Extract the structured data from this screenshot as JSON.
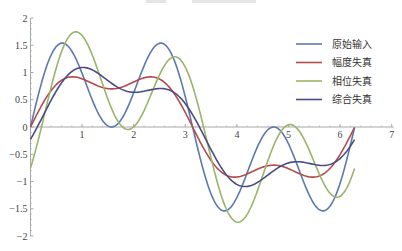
{
  "chart_data": {
    "type": "line",
    "title": "",
    "xlabel": "",
    "ylabel": "",
    "xlim": [
      0,
      7
    ],
    "ylim": [
      -2,
      2
    ],
    "x_ticks": [
      1,
      2,
      3,
      4,
      5,
      6,
      7
    ],
    "y_ticks": [
      -2,
      -1.5,
      -1,
      -0.5,
      0,
      0.5,
      1,
      1.5,
      2
    ],
    "x_tick_labels": [
      "1",
      "2",
      "3",
      "4",
      "5",
      "6",
      "7"
    ],
    "y_tick_labels": [
      "−2",
      "−1.5",
      "−1",
      "−0.5",
      "0",
      "0.5",
      "1",
      "1.5",
      "2"
    ],
    "grid": false,
    "legend_position": "upper right",
    "t_range": [
      0,
      6.28
    ],
    "x": [
      0,
      0.25,
      0.5,
      0.75,
      1.0,
      1.25,
      1.5,
      1.75,
      2.0,
      2.25,
      2.5,
      2.75,
      3.0,
      3.25,
      3.5,
      3.75,
      4.0,
      4.25,
      4.5,
      4.75,
      5.0,
      5.25,
      5.5,
      5.75,
      6.0,
      6.28
    ],
    "series": [
      {
        "name": "原始输入",
        "color": "#5b79ad",
        "formula": "sin(t) + sin(3t)",
        "values": [
          0.0,
          0.93,
          1.48,
          1.46,
          0.98,
          0.38,
          0.02,
          0.12,
          0.63,
          1.23,
          1.53,
          1.28,
          0.55,
          -0.21,
          -0.67,
          -0.65,
          -1.29,
          -1.53,
          -1.23,
          -0.63,
          -0.12,
          -0.02,
          -0.38,
          -0.98,
          -1.46,
          -0.0
        ]
      },
      {
        "name": "幅度失真",
        "color": "#b54a4a",
        "formula": "sin(t) + 0.3 sin(3t)",
        "values": [
          0.0,
          0.45,
          0.78,
          0.91,
          0.88,
          0.78,
          0.72,
          0.75,
          0.82,
          0.88,
          0.86,
          0.73,
          0.37,
          -0.09,
          -0.44,
          -0.7,
          -0.88,
          -0.87,
          -0.79,
          -0.73,
          -0.75,
          -0.81,
          -0.87,
          -0.84,
          -0.56,
          -0.0
        ]
      },
      {
        "name": "相位失真",
        "color": "#9bb46c",
        "formula": "sin(t) + sin(3t - 0.85)",
        "values": [
          -0.75,
          0.16,
          1.01,
          1.59,
          1.71,
          1.35,
          0.69,
          0.07,
          -0.11,
          0.25,
          0.93,
          1.56,
          1.25,
          0.44,
          -0.51,
          -1.3,
          -1.69,
          -1.59,
          -0.99,
          -0.25,
          0.05,
          -0.13,
          -0.72,
          -1.33,
          -1.5,
          -0.75
        ]
      },
      {
        "name": "综合失真",
        "color": "#4b4c86",
        "formula": "sin(t) + 0.3 sin(3t - 0.85)",
        "values": [
          -0.23,
          0.18,
          0.63,
          0.96,
          1.09,
          1.03,
          0.88,
          0.76,
          0.71,
          0.71,
          0.65,
          0.49,
          0.21,
          -0.12,
          -0.5,
          -0.82,
          -1.02,
          -1.06,
          -0.97,
          -0.81,
          -0.69,
          -0.66,
          -0.7,
          -0.74,
          -0.7,
          -0.23
        ]
      }
    ]
  },
  "legend": {
    "items": [
      {
        "label": "原始输入",
        "color": "#5b79ad"
      },
      {
        "label": "幅度失真",
        "color": "#b54a4a"
      },
      {
        "label": "相位失真",
        "color": "#9bb46c"
      },
      {
        "label": "综合失真",
        "color": "#4b4c86"
      }
    ]
  }
}
